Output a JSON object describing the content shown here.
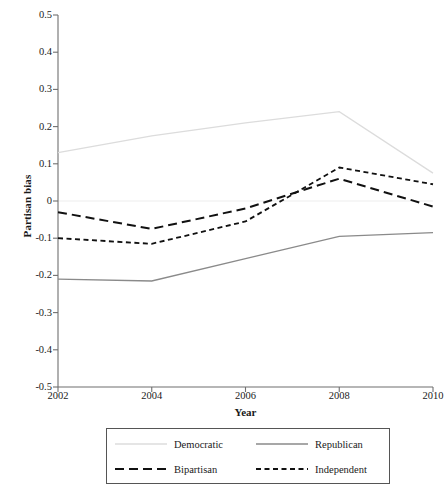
{
  "chart_data": {
    "type": "line",
    "title": "",
    "xlabel": "Year",
    "ylabel": "Partisan bias",
    "x": [
      2002,
      2004,
      2006,
      2008,
      2010
    ],
    "xticklabels": [
      "2002",
      "2004",
      "2006",
      "2008",
      "2010"
    ],
    "xlim": [
      2002,
      2010
    ],
    "ylim": [
      -0.5,
      0.5
    ],
    "yticks": [
      0.5,
      0.4,
      0.3,
      0.2,
      0.1,
      0,
      -0.1,
      -0.2,
      -0.3,
      -0.4,
      -0.5
    ],
    "yticklabels": [
      "0.5",
      "0.4",
      "0.3",
      "0.2",
      "0.1",
      "0",
      "-0.1",
      "-0.2",
      "-0.3",
      "-0.4",
      "-0.5"
    ],
    "grid": false,
    "legend_position": "below-axes",
    "zero_line": true,
    "series": [
      {
        "name": "Democratic",
        "values": [
          0.13,
          0.175,
          0.21,
          0.24,
          0.075
        ],
        "color": "#dcdcdc",
        "style": "solid",
        "width": 1.3
      },
      {
        "name": "Republican",
        "values": [
          -0.21,
          -0.215,
          -0.155,
          -0.095,
          -0.085
        ],
        "color": "#8a8a8a",
        "style": "solid",
        "width": 1.3
      },
      {
        "name": "Bipartisan",
        "values": [
          -0.03,
          -0.075,
          -0.02,
          0.06,
          -0.015
        ],
        "color": "#111111",
        "style": "long-dash",
        "width": 2.0
      },
      {
        "name": "Independent",
        "values": [
          -0.1,
          -0.115,
          -0.055,
          0.09,
          0.045
        ],
        "color": "#111111",
        "style": "short-dash",
        "width": 1.8
      }
    ]
  },
  "axes": {
    "ylabel": "Partisan bias",
    "xlabel": "Year"
  },
  "legend": {
    "entries": [
      {
        "label": "Democratic"
      },
      {
        "label": "Republican"
      },
      {
        "label": "Bipartisan"
      },
      {
        "label": "Independent"
      }
    ]
  },
  "colors": {
    "democratic": "#dcdcdc",
    "republican": "#8a8a8a",
    "bipartisan": "#111111",
    "independent": "#111111",
    "axis": "#6f6f6f",
    "zero_line": "#ededed"
  }
}
